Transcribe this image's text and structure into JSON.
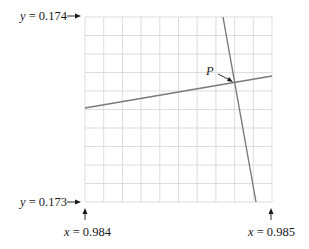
{
  "figure": {
    "grid": {
      "x0": 85,
      "y0": 17,
      "x1": 272,
      "y1": 202,
      "cols": 10,
      "rows": 10,
      "color": "#d4d4d4"
    },
    "labels": {
      "y_top": {
        "var": "y",
        "eq": " = 0.174"
      },
      "y_bottom": {
        "var": "y",
        "eq": " = 0.173"
      },
      "x_left": {
        "var": "x",
        "eq": " = 0.984"
      },
      "x_right": {
        "var": "x",
        "eq": " = 0.985"
      },
      "point": "P"
    },
    "lines": [
      {
        "name": "shallow-line",
        "x1": 85,
        "y1": 108,
        "x2": 272,
        "y2": 76,
        "color": "#7a7a7a"
      },
      {
        "name": "steep-line",
        "x1": 223,
        "y1": 17,
        "x2": 256,
        "y2": 202,
        "color": "#7a7a7a"
      }
    ],
    "intersection": {
      "x": 234,
      "y": 82
    }
  }
}
